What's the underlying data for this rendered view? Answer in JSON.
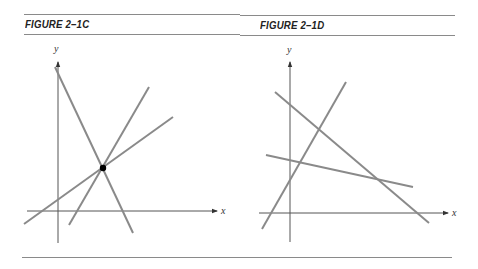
{
  "figures": [
    {
      "title": "FIGURE 2–1C",
      "x_axis_label": "x",
      "y_axis_label": "y",
      "description": "Three lines intersecting at a single common point (marked with a dot)"
    },
    {
      "title": "FIGURE 2–1D",
      "x_axis_label": "x",
      "y_axis_label": "y",
      "description": "Three lines intersecting pairwise at three distinct points"
    }
  ],
  "colors": {
    "line": "#8a8a8a",
    "axis": "#555555",
    "rule": "#8a8a8a",
    "dot": "#000000"
  }
}
